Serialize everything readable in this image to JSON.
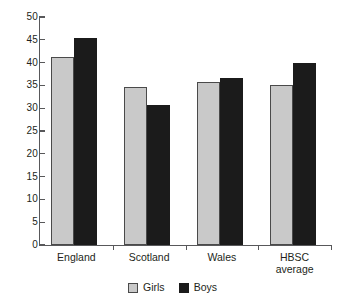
{
  "chart_data": {
    "type": "bar",
    "title": "",
    "subtitle": "",
    "xlabel": "",
    "ylabel": "",
    "categories": [
      "England",
      "Scotland",
      "Wales",
      "HBSC\naverage"
    ],
    "series": [
      {
        "name": "Girls",
        "color": "#c9c9c9",
        "values": [
          41.2,
          34.6,
          35.8,
          35.1
        ]
      },
      {
        "name": "Boys",
        "color": "#1b1b1b",
        "values": [
          45.4,
          30.8,
          36.6,
          39.9
        ]
      }
    ],
    "ylim": [
      0,
      50
    ],
    "ytick_step": 5,
    "ytick_labels": [
      "0",
      "5",
      "10",
      "15",
      "20",
      "25",
      "30",
      "35",
      "40",
      "45",
      "50"
    ],
    "grid": false,
    "legend_position": "bottom-center",
    "annotations": []
  },
  "legend": {
    "entries": [
      {
        "label": "Girls",
        "swatch": "girls-swatch"
      },
      {
        "label": "Boys",
        "swatch": "boys-swatch"
      }
    ]
  }
}
